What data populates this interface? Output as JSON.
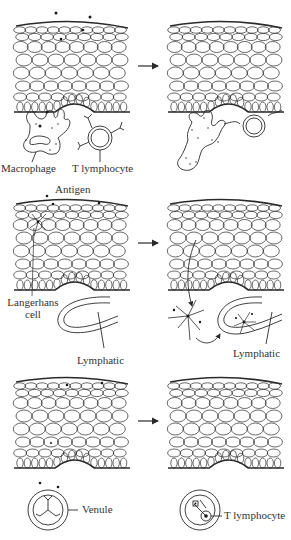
{
  "panels": [
    {
      "id": "macrophage-panel",
      "labels": {
        "left_a": "Macrophage",
        "left_b": "T lymphocyte"
      }
    },
    {
      "id": "langerhans-panel",
      "labels": {
        "antigen": "Antigen",
        "langerhans_1": "Langerhans",
        "langerhans_2": "cell",
        "lymphatic_left": "Lymphatic",
        "lymphatic_right": "Lymphatic"
      }
    },
    {
      "id": "venule-panel",
      "labels": {
        "venule": "Venule",
        "t_lymphocyte": "T lymphocyte"
      }
    }
  ],
  "arrow_symbol": "→",
  "colors": {
    "stroke": "#2a2a2a",
    "background": "#ffffff"
  }
}
